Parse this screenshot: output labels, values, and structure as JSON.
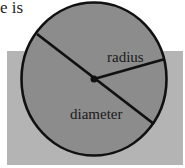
{
  "caption_fragment": "e is",
  "diagram": {
    "shape": "circle",
    "labels": {
      "radius": "radius",
      "diameter": "diameter"
    },
    "colors": {
      "background_rect": "#b4b4b4",
      "circle_fill": "#8c8c8c",
      "stroke": "#111111"
    }
  }
}
